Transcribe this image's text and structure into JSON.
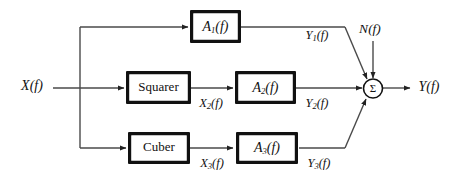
{
  "diagram": {
    "type": "block-diagram",
    "colors": {
      "background": "#ffffff",
      "wire": "#4a4a4a",
      "box_border": "#111111",
      "box_fill": "#ffffff",
      "text": "#111111"
    },
    "inputs": [
      {
        "id": "input-x",
        "label": "X(f)"
      },
      {
        "id": "input-noise",
        "label": "N(f)"
      }
    ],
    "outputs": [
      {
        "id": "output-y",
        "label": "Y(f)"
      }
    ],
    "blocks": [
      {
        "id": "block-a1",
        "label": "A",
        "subscript": "1",
        "arg": "(f)",
        "style": "italic"
      },
      {
        "id": "block-squarer",
        "label": "Squarer",
        "style": "upright"
      },
      {
        "id": "block-a2",
        "label": "A",
        "subscript": "2",
        "arg": "(f)",
        "style": "italic"
      },
      {
        "id": "block-cuber",
        "label": "Cuber",
        "style": "upright"
      },
      {
        "id": "block-a3",
        "label": "A",
        "subscript": "3",
        "arg": "(f)",
        "style": "italic"
      }
    ],
    "summing_junction": {
      "id": "summing-junction",
      "symbol": "Σ",
      "name": "sigma"
    },
    "signal_labels": [
      {
        "id": "label-y1",
        "base": "Y",
        "subscript": "1",
        "arg": "(f)"
      },
      {
        "id": "label-x2",
        "base": "X",
        "subscript": "2",
        "arg": "(f)"
      },
      {
        "id": "label-y2",
        "base": "Y",
        "subscript": "2",
        "arg": "(f)"
      },
      {
        "id": "label-x3",
        "base": "X",
        "subscript": "3",
        "arg": "(f)"
      },
      {
        "id": "label-y3",
        "base": "Y",
        "subscript": "3",
        "arg": "(f)"
      }
    ],
    "text": {
      "x_in": "X(f)",
      "n_in": "N(f)",
      "y_out": "Y(f)",
      "squarer": "Squarer",
      "cuber": "Cuber",
      "a_base": "A",
      "x_base": "X",
      "y_base": "Y",
      "arg": "(f)",
      "sub1": "1",
      "sub2": "2",
      "sub3": "3",
      "sigma": "Σ"
    }
  }
}
